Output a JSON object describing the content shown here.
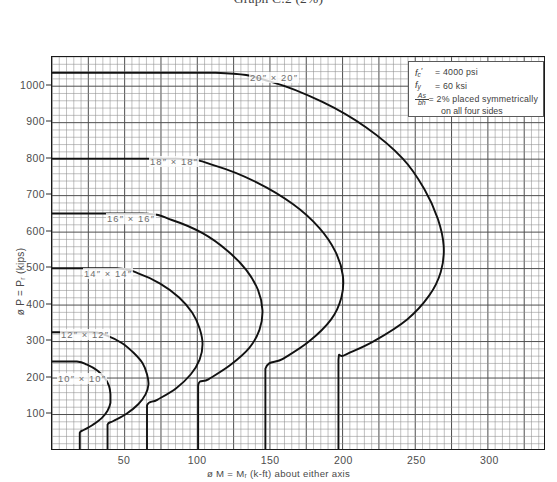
{
  "title": "Graph C.2 (2%)",
  "axes": {
    "y_title": "ø P = Pᵣ (kips)",
    "x_title": "ø M = Mᵣ (k-ft) about either axis",
    "y_ticks": [
      100,
      200,
      300,
      400,
      500,
      600,
      700,
      800,
      900,
      1000
    ],
    "x_ticks": [
      50,
      100,
      150,
      200,
      250,
      300
    ],
    "xlim": [
      0,
      338
    ],
    "ylim": [
      0,
      1078
    ]
  },
  "legend": {
    "fc_symbol": "f'c",
    "fc_value": "= 4000 psi",
    "fy_symbol": "fy",
    "fy_value": "= 60 ksi",
    "as_num": "As",
    "as_den": "bh",
    "as_value": "= 2% placed symmetrically",
    "as_value_cont": "on all four sides"
  },
  "chart_data": {
    "type": "line",
    "title": "Graph C.2 (2%)",
    "xlabel": "ø M = Mᵣ (k-ft) about either axis",
    "ylabel": "ø P = Pᵣ (kips)",
    "xlim": [
      0,
      338
    ],
    "ylim": [
      0,
      1078
    ],
    "grid": true,
    "legend_position": "top-right-box",
    "note": "ACI column interaction diagrams, square tied columns, f'c=4000psi, fy=60ksi, rho=2%",
    "series": [
      {
        "name": "20\" x 20\"",
        "label": "20″ × 20″",
        "points": [
          [
            0,
            1035
          ],
          [
            112,
            1035
          ],
          [
            150,
            1010
          ],
          [
            185,
            955
          ],
          [
            215,
            885
          ],
          [
            240,
            800
          ],
          [
            255,
            715
          ],
          [
            264,
            635
          ],
          [
            268,
            560
          ],
          [
            266,
            490
          ],
          [
            258,
            425
          ],
          [
            243,
            360
          ],
          [
            220,
            300
          ],
          [
            200,
            262
          ],
          [
            196,
            250
          ],
          [
            196,
            110
          ],
          [
            196,
            0
          ]
        ]
      },
      {
        "name": "18\" x 18\"",
        "label": "18″ × 18″",
        "points": [
          [
            0,
            800
          ],
          [
            85,
            800
          ],
          [
            112,
            780
          ],
          [
            140,
            735
          ],
          [
            165,
            675
          ],
          [
            183,
            610
          ],
          [
            194,
            545
          ],
          [
            199,
            480
          ],
          [
            198,
            420
          ],
          [
            191,
            360
          ],
          [
            176,
            300
          ],
          [
            158,
            252
          ],
          [
            146,
            225
          ],
          [
            146,
            110
          ],
          [
            146,
            0
          ]
        ]
      },
      {
        "name": "16\" x 16\"",
        "label": "16″ × 16″",
        "points": [
          [
            0,
            650
          ],
          [
            62,
            650
          ],
          [
            82,
            632
          ],
          [
            103,
            596
          ],
          [
            120,
            548
          ],
          [
            133,
            495
          ],
          [
            141,
            440
          ],
          [
            144,
            385
          ],
          [
            142,
            332
          ],
          [
            135,
            282
          ],
          [
            122,
            235
          ],
          [
            107,
            196
          ],
          [
            100,
            180
          ],
          [
            100,
            90
          ],
          [
            100,
            0
          ]
        ]
      },
      {
        "name": "14\" x 14\"",
        "label": "14″ × 14″",
        "points": [
          [
            0,
            500
          ],
          [
            44,
            500
          ],
          [
            59,
            486
          ],
          [
            74,
            458
          ],
          [
            87,
            420
          ],
          [
            96,
            378
          ],
          [
            101,
            335
          ],
          [
            103,
            292
          ],
          [
            101,
            250
          ],
          [
            95,
            210
          ],
          [
            85,
            172
          ],
          [
            72,
            140
          ],
          [
            65,
            125
          ],
          [
            65,
            60
          ],
          [
            65,
            0
          ]
        ]
      },
      {
        "name": "12\" x 12\"",
        "label": "12″ × 12″",
        "points": [
          [
            0,
            325
          ],
          [
            28,
            325
          ],
          [
            38,
            315
          ],
          [
            48,
            295
          ],
          [
            56,
            268
          ],
          [
            62,
            240
          ],
          [
            65,
            210
          ],
          [
            66,
            182
          ],
          [
            64,
            155
          ],
          [
            59,
            128
          ],
          [
            51,
            102
          ],
          [
            42,
            82
          ],
          [
            38,
            72
          ],
          [
            38,
            36
          ],
          [
            38,
            0
          ]
        ]
      },
      {
        "name": "10\" x 10\"",
        "label": "10″ × 10″",
        "points": [
          [
            0,
            245
          ],
          [
            17,
            245
          ],
          [
            24,
            236
          ],
          [
            31,
            220
          ],
          [
            36,
            200
          ],
          [
            39,
            178
          ],
          [
            40,
            155
          ],
          [
            40,
            132
          ],
          [
            38,
            110
          ],
          [
            34,
            90
          ],
          [
            28,
            72
          ],
          [
            22,
            58
          ],
          [
            19,
            50
          ],
          [
            19,
            24
          ],
          [
            19,
            0
          ]
        ]
      }
    ],
    "curve_labels": [
      {
        "text": "20″ × 20″",
        "x": 248,
        "y": 71
      },
      {
        "text": "18″ × 18″",
        "x": 148,
        "y": 155
      },
      {
        "text": "16″ × 16″",
        "x": 105,
        "y": 212
      },
      {
        "text": "14″ × 14″",
        "x": 82,
        "y": 267
      },
      {
        "text": "12″ × 12″",
        "x": 59,
        "y": 328
      },
      {
        "text": "10″ × 10″",
        "x": 56,
        "y": 372
      }
    ]
  }
}
